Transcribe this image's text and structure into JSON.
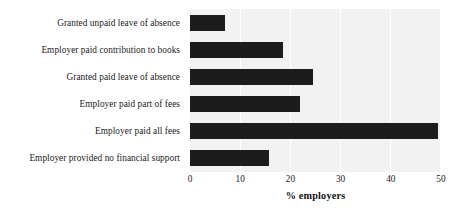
{
  "chart_data": {
    "type": "bar",
    "orientation": "horizontal",
    "title": "",
    "xlabel": "% employers",
    "ylabel": "",
    "xlim": [
      0,
      50
    ],
    "xticks": [
      0,
      10,
      20,
      30,
      40,
      50
    ],
    "xtick_labels": [
      "0",
      "10",
      "20",
      "30",
      "40",
      "50"
    ],
    "grid": "vertical-white-gridlines",
    "legend": "none",
    "bar_color": "#1c1c1c",
    "panel_color": "#f2f2f2",
    "categories": [
      "Granted unpaid leave of absence",
      "Employer paid contribution to books",
      "Granted paid leave of absence",
      "Employer paid part of fees",
      "Employer paid all fees",
      "Employer provided no financial support"
    ],
    "values": [
      7,
      18.5,
      24.5,
      22,
      49.5,
      15.7
    ]
  }
}
